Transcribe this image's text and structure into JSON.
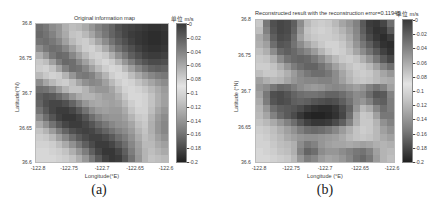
{
  "chart_data": [
    {
      "type": "heatmap",
      "title": "Original information map",
      "xlabel": "Longitude(°E)",
      "ylabel": "Latitude(°N)",
      "x_ticks": [
        "-122.8",
        "-122.75",
        "-122.7",
        "-122.65",
        "-122.6"
      ],
      "y_ticks": [
        "36.8",
        "36.75",
        "36.7",
        "36.65",
        "36.6"
      ],
      "xlim": [
        -122.8,
        -122.6
      ],
      "ylim": [
        36.6,
        36.8
      ],
      "colorbar": {
        "unit_label": "单位  m/s",
        "ticks": [
          "0",
          "-0.02",
          "-0.04",
          "-0.06",
          "-0.08",
          "-0.1",
          "-0.12",
          "-0.14",
          "-0.16",
          "-0.18",
          "-0.2"
        ],
        "range": [
          -0.2,
          0
        ],
        "colormap": "gray dark-light-dark"
      },
      "caption": "(a)",
      "grid_gray_rows_top_to_bottom": [
        [
          110,
          120,
          140,
          150,
          175,
          190,
          185,
          170,
          150,
          130,
          115,
          100,
          80,
          70,
          65,
          60,
          55,
          50,
          50,
          55
        ],
        [
          105,
          115,
          130,
          150,
          170,
          195,
          200,
          185,
          165,
          140,
          120,
          100,
          85,
          70,
          60,
          55,
          50,
          45,
          45,
          50
        ],
        [
          115,
          110,
          120,
          135,
          160,
          185,
          200,
          205,
          190,
          165,
          140,
          115,
          95,
          80,
          65,
          55,
          50,
          45,
          45,
          50
        ],
        [
          140,
          120,
          110,
          115,
          135,
          160,
          185,
          205,
          210,
          195,
          170,
          140,
          115,
          95,
          80,
          65,
          55,
          50,
          50,
          55
        ],
        [
          175,
          150,
          120,
          105,
          110,
          135,
          160,
          185,
          205,
          210,
          200,
          175,
          145,
          120,
          95,
          80,
          65,
          60,
          60,
          65
        ],
        [
          200,
          190,
          160,
          125,
          105,
          110,
          135,
          160,
          185,
          205,
          215,
          205,
          180,
          150,
          125,
          100,
          85,
          75,
          75,
          80
        ],
        [
          205,
          210,
          195,
          165,
          130,
          110,
          115,
          135,
          160,
          185,
          205,
          215,
          210,
          185,
          160,
          135,
          115,
          100,
          95,
          100
        ],
        [
          185,
          200,
          210,
          205,
          180,
          150,
          125,
          120,
          130,
          155,
          180,
          205,
          215,
          210,
          190,
          170,
          150,
          135,
          125,
          120
        ],
        [
          140,
          165,
          185,
          200,
          205,
          190,
          165,
          145,
          135,
          140,
          160,
          185,
          205,
          215,
          210,
          195,
          180,
          165,
          150,
          140
        ],
        [
          110,
          115,
          130,
          155,
          180,
          195,
          195,
          180,
          160,
          150,
          150,
          165,
          190,
          210,
          215,
          210,
          200,
          185,
          170,
          155
        ],
        [
          95,
          85,
          90,
          105,
          125,
          150,
          170,
          180,
          180,
          170,
          160,
          160,
          175,
          200,
          215,
          215,
          210,
          195,
          175,
          160
        ],
        [
          100,
          80,
          70,
          70,
          80,
          100,
          125,
          150,
          165,
          170,
          165,
          160,
          165,
          185,
          205,
          215,
          210,
          195,
          175,
          160
        ],
        [
          115,
          90,
          70,
          60,
          60,
          70,
          90,
          115,
          140,
          155,
          160,
          155,
          155,
          170,
          195,
          210,
          210,
          190,
          165,
          150
        ],
        [
          140,
          110,
          85,
          65,
          55,
          55,
          65,
          85,
          110,
          130,
          145,
          150,
          150,
          160,
          180,
          200,
          205,
          180,
          155,
          140
        ],
        [
          170,
          145,
          115,
          90,
          70,
          60,
          60,
          70,
          85,
          105,
          120,
          135,
          145,
          150,
          165,
          190,
          200,
          175,
          150,
          135
        ],
        [
          195,
          180,
          155,
          125,
          100,
          80,
          70,
          65,
          70,
          85,
          100,
          115,
          130,
          140,
          155,
          180,
          195,
          175,
          150,
          135
        ],
        [
          205,
          200,
          185,
          160,
          135,
          110,
          90,
          75,
          65,
          65,
          75,
          90,
          110,
          125,
          145,
          170,
          190,
          180,
          160,
          145
        ],
        [
          210,
          210,
          205,
          190,
          170,
          145,
          120,
          95,
          75,
          60,
          60,
          70,
          90,
          110,
          135,
          160,
          185,
          185,
          170,
          160
        ],
        [
          215,
          215,
          210,
          205,
          195,
          175,
          150,
          125,
          95,
          70,
          55,
          55,
          70,
          95,
          125,
          155,
          180,
          190,
          180,
          170
        ],
        [
          215,
          215,
          215,
          210,
          205,
          195,
          175,
          150,
          120,
          90,
          65,
          55,
          60,
          85,
          115,
          150,
          180,
          195,
          190,
          185
        ]
      ]
    },
    {
      "type": "heatmap",
      "title": "Reconstructed result with the reconstruction error=0.11945",
      "xlabel": "Longitude (°E)",
      "ylabel": "Latitude (°N)",
      "x_ticks": [
        "-122.8",
        "-122.75",
        "-122.7",
        "-122.65",
        "-122.6"
      ],
      "y_ticks": [
        "36.8",
        "36.75",
        "36.7",
        "36.65",
        "36.6"
      ],
      "xlim": [
        -122.8,
        -122.6
      ],
      "ylim": [
        36.6,
        36.8
      ],
      "reconstruction_error": 0.11945,
      "colorbar": {
        "unit_label": "单位  m/s",
        "ticks": [
          "0",
          "-0.02",
          "-0.04",
          "-0.06",
          "-0.08",
          "-0.1",
          "-0.12",
          "-0.14",
          "-0.16",
          "-0.18",
          "-0.2"
        ],
        "range": [
          -0.2,
          0
        ],
        "colormap": "gray dark-light-dark"
      },
      "caption": "(b)",
      "grid_gray_rows_top_to_bottom": [
        [
          200,
          120,
          80,
          70,
          75,
          95,
          140,
          185,
          200,
          205,
          200,
          185,
          165,
          150,
          130,
          90,
          60,
          55,
          70,
          110
        ],
        [
          190,
          130,
          85,
          70,
          75,
          100,
          150,
          195,
          205,
          210,
          205,
          195,
          180,
          160,
          135,
          95,
          65,
          50,
          55,
          90
        ],
        [
          170,
          145,
          95,
          75,
          80,
          110,
          160,
          190,
          200,
          205,
          205,
          200,
          190,
          170,
          140,
          105,
          75,
          55,
          45,
          60
        ],
        [
          175,
          160,
          110,
          85,
          90,
          115,
          140,
          165,
          185,
          200,
          210,
          210,
          200,
          180,
          150,
          120,
          95,
          70,
          50,
          45
        ],
        [
          190,
          175,
          140,
          105,
          95,
          105,
          120,
          135,
          155,
          180,
          200,
          210,
          205,
          190,
          165,
          140,
          115,
          90,
          65,
          50
        ],
        [
          200,
          195,
          175,
          140,
          115,
          105,
          100,
          105,
          120,
          140,
          165,
          185,
          200,
          205,
          195,
          175,
          150,
          120,
          90,
          70
        ],
        [
          205,
          205,
          195,
          175,
          150,
          125,
          110,
          100,
          100,
          115,
          135,
          160,
          180,
          195,
          205,
          200,
          185,
          160,
          130,
          110
        ],
        [
          190,
          200,
          200,
          190,
          175,
          155,
          135,
          120,
          110,
          110,
          120,
          140,
          165,
          185,
          200,
          205,
          200,
          185,
          165,
          150
        ],
        [
          160,
          175,
          185,
          180,
          165,
          150,
          140,
          135,
          135,
          130,
          130,
          140,
          160,
          180,
          195,
          200,
          195,
          185,
          175,
          170
        ],
        [
          150,
          140,
          120,
          105,
          110,
          125,
          140,
          150,
          155,
          150,
          140,
          135,
          140,
          150,
          160,
          150,
          130,
          115,
          130,
          160
        ],
        [
          160,
          120,
          80,
          75,
          85,
          100,
          110,
          115,
          115,
          110,
          100,
          100,
          110,
          125,
          140,
          135,
          110,
          85,
          90,
          130
        ],
        [
          170,
          125,
          85,
          75,
          80,
          95,
          100,
          95,
          85,
          80,
          75,
          80,
          95,
          115,
          140,
          150,
          130,
          100,
          95,
          125
        ],
        [
          180,
          150,
          110,
          95,
          90,
          85,
          75,
          60,
          50,
          45,
          45,
          55,
          75,
          100,
          150,
          185,
          170,
          135,
          110,
          125
        ],
        [
          185,
          165,
          130,
          105,
          90,
          75,
          55,
          40,
          35,
          35,
          40,
          50,
          70,
          110,
          170,
          200,
          195,
          160,
          120,
          120
        ],
        [
          195,
          185,
          170,
          150,
          130,
          110,
          85,
          65,
          55,
          55,
          60,
          75,
          95,
          130,
          175,
          200,
          200,
          180,
          145,
          130
        ],
        [
          205,
          200,
          190,
          175,
          160,
          145,
          125,
          110,
          105,
          110,
          120,
          135,
          155,
          175,
          195,
          205,
          200,
          185,
          160,
          145
        ],
        [
          210,
          205,
          195,
          185,
          170,
          160,
          150,
          145,
          145,
          150,
          155,
          160,
          170,
          185,
          195,
          200,
          195,
          185,
          170,
          160
        ],
        [
          210,
          210,
          200,
          190,
          185,
          175,
          140,
          120,
          130,
          150,
          160,
          165,
          165,
          170,
          165,
          160,
          165,
          175,
          180,
          175
        ],
        [
          215,
          210,
          205,
          195,
          190,
          175,
          130,
          100,
          110,
          140,
          150,
          150,
          140,
          130,
          120,
          115,
          130,
          160,
          180,
          185
        ],
        [
          215,
          215,
          210,
          205,
          200,
          185,
          150,
          125,
          135,
          155,
          165,
          160,
          150,
          135,
          115,
          105,
          120,
          155,
          180,
          190
        ]
      ]
    }
  ],
  "panels": [
    {
      "title": "Original information map",
      "unit": "单位  m/s",
      "xlabel": "Longitude(°E)",
      "ylabel": "Latitude(°N)",
      "caption": "(a)"
    },
    {
      "title": "Reconstructed result with the reconstruction error=0.11945",
      "unit": "单位  m/s",
      "xlabel": "Longitude (°E)",
      "ylabel": "Latitude (°N)",
      "caption": "(b)"
    }
  ],
  "x_ticks": [
    "-122.8",
    "-122.75",
    "-122.7",
    "-122.65",
    "-122.6"
  ],
  "y_ticks": [
    "36.8",
    "36.75",
    "36.7",
    "36.65",
    "36.6"
  ],
  "cbar_ticks": [
    "0",
    "-0.02",
    "-0.04",
    "-0.06",
    "-0.08",
    "-0.1",
    "-0.12",
    "-0.14",
    "-0.16",
    "-0.18",
    "-0.2"
  ]
}
